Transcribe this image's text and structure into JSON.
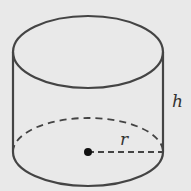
{
  "diagram": {
    "labels": {
      "height": "h",
      "radius": "r"
    },
    "colors": {
      "background": "#e9e9e9",
      "stroke": "#444444",
      "center_dot": "#111111"
    }
  }
}
